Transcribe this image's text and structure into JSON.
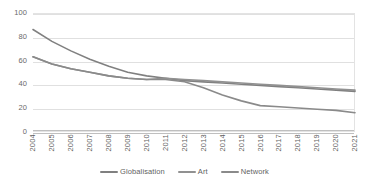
{
  "chart_data": {
    "type": "line",
    "title": "",
    "subtitle": "",
    "xlabel": "",
    "ylabel": "",
    "xlim": [
      2004,
      2021
    ],
    "ylim": [
      0,
      100
    ],
    "grid": true,
    "legend_position": "bottom",
    "categories": [
      "2004",
      "2005",
      "2006",
      "2007",
      "2008",
      "2009",
      "2010",
      "2011",
      "2012",
      "2013",
      "2014",
      "2015",
      "2016",
      "2017",
      "2018",
      "2019",
      "2020",
      "2021"
    ],
    "y_ticks": [
      0,
      20,
      40,
      60,
      80,
      100
    ],
    "y_tick_labels": [
      "0",
      "20",
      "40",
      "60",
      "80",
      "100"
    ],
    "series": [
      {
        "name": "Globalisation",
        "color": "#808080",
        "values": [
          87,
          77,
          69,
          62,
          56,
          51,
          48,
          46,
          44,
          43,
          42,
          41,
          40,
          39,
          38,
          37,
          36,
          35
        ]
      },
      {
        "name": "Art",
        "color": "#919191",
        "values": [
          64,
          58,
          54,
          51,
          48,
          46,
          45,
          46,
          45,
          44,
          43,
          42,
          41,
          40,
          39,
          38,
          37,
          36
        ]
      },
      {
        "name": "Network",
        "color": "#8a8a8a",
        "values": [
          64,
          58,
          54,
          51,
          48,
          46,
          45,
          45,
          43,
          38,
          32,
          27,
          23,
          22,
          21,
          20,
          19,
          17
        ]
      }
    ]
  },
  "legend": {
    "items": [
      {
        "label": "Globalisation",
        "color": "#808080"
      },
      {
        "label": "Art",
        "color": "#919191"
      },
      {
        "label": "Network",
        "color": "#8a8a8a"
      }
    ]
  },
  "colors": {
    "gridline": "#e0e0e0",
    "axis": "#bfbfbf",
    "tick_text": "#5f5f5f",
    "background": "#ffffff"
  }
}
